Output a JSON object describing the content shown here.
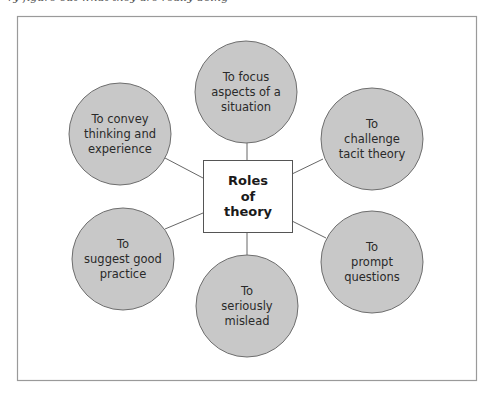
{
  "header": {
    "cut_off_text": "ry figure out what they are really doing"
  },
  "colors": {
    "frame": "#9a9a9a",
    "circle_fill": "#c8c8c8",
    "circle_stroke": "#6e6e6e",
    "line": "#555555",
    "box_stroke": "#555555"
  },
  "diagram": {
    "center": {
      "label": "Roles\nof\ntheory"
    },
    "nodes": [
      {
        "id": "focus",
        "label": "To focus\naspects of a\nsituation"
      },
      {
        "id": "challenge",
        "label": "To\nchallenge\ntacit theory"
      },
      {
        "id": "prompt",
        "label": "To\nprompt\nquestions"
      },
      {
        "id": "mislead",
        "label": "To\nseriously\nmislead"
      },
      {
        "id": "suggest",
        "label": "To\nsuggest good\npractice"
      },
      {
        "id": "convey",
        "label": "To convey\nthinking and\nexperience"
      }
    ]
  }
}
